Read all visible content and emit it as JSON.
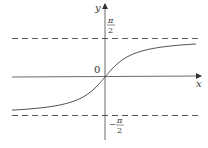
{
  "figure": {
    "function": "arctan",
    "axes": {
      "x_label": "x",
      "y_label": "y",
      "origin_label": "0"
    },
    "asymptotes": [
      {
        "name": "upper",
        "value_label_num": "π",
        "value_label_den": "2",
        "sign": ""
      },
      {
        "name": "lower",
        "value_label_num": "π",
        "value_label_den": "2",
        "sign": "−"
      }
    ],
    "colors": {
      "curve": "#555555",
      "axis": "#444444",
      "asymptote": "#444444",
      "background": "#ffffff"
    }
  },
  "layout": {
    "origin": [
      105,
      77
    ],
    "half_pi_px": 38.5,
    "x_scale_px": 20.7,
    "x_range_px": [
      12,
      196
    ]
  }
}
